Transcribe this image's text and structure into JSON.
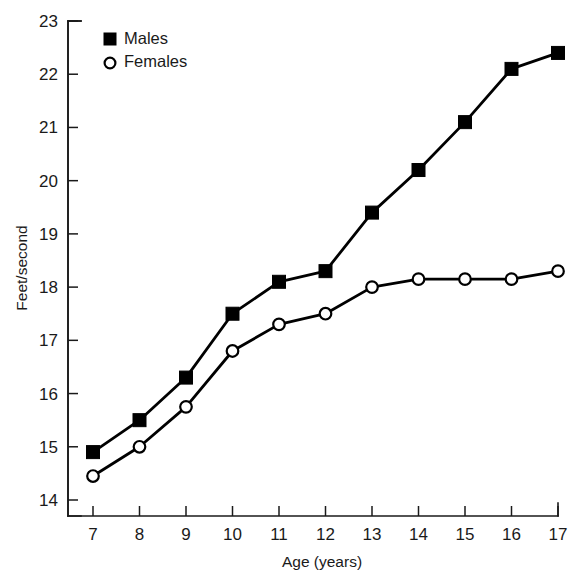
{
  "chart_data": {
    "type": "line",
    "title": "",
    "xlabel": "Age (years)",
    "ylabel": "Feet/second",
    "x": [
      7,
      8,
      9,
      10,
      11,
      12,
      13,
      14,
      15,
      16,
      17
    ],
    "categories": [
      "7",
      "8",
      "9",
      "10",
      "11",
      "12",
      "13",
      "14",
      "15",
      "16",
      "17"
    ],
    "series": [
      {
        "name": "Males",
        "marker": "filled-square",
        "color": "#000000",
        "values": [
          14.9,
          15.5,
          16.3,
          17.5,
          18.1,
          18.3,
          19.4,
          20.2,
          21.1,
          22.1,
          22.4
        ]
      },
      {
        "name": "Females",
        "marker": "open-circle",
        "color": "#000000",
        "values": [
          14.45,
          15.0,
          15.75,
          16.8,
          17.3,
          17.5,
          18.0,
          18.15,
          18.15,
          18.15,
          18.3
        ]
      }
    ],
    "xlim": [
      7,
      17
    ],
    "ylim": [
      13.6,
      23
    ],
    "ytick_values": [
      14,
      15,
      16,
      17,
      18,
      19,
      20,
      21,
      22,
      23
    ],
    "ytick_labels": [
      "14",
      "15",
      "16",
      "17",
      "18",
      "19",
      "20",
      "21",
      "22",
      "23"
    ],
    "xtick_values": [
      7,
      8,
      9,
      10,
      11,
      12,
      13,
      14,
      15,
      16,
      17
    ],
    "xtick_labels": [
      "7",
      "8",
      "9",
      "10",
      "11",
      "12",
      "13",
      "14",
      "15",
      "16",
      "17"
    ],
    "grid": false,
    "legend_position": "top-left",
    "legend": [
      "Males",
      "Females"
    ]
  },
  "axes": {
    "y_title": "Feet/second",
    "x_title": "Age (years)"
  },
  "legend": {
    "entries": [
      {
        "label": "Males",
        "marker": "filled-square"
      },
      {
        "label": "Females",
        "marker": "open-circle"
      }
    ]
  }
}
